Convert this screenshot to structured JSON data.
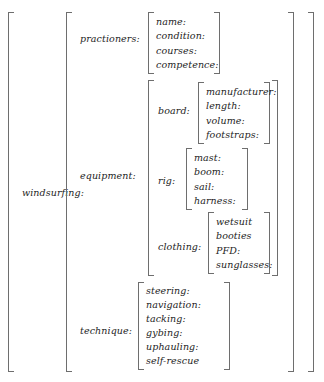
{
  "diagram": {
    "type": "attribute-value-matrix",
    "root": {
      "label": "windsurfing:"
    },
    "level2": [
      {
        "label": "practioners:"
      },
      {
        "label": "equipment:"
      },
      {
        "label": "technique:"
      }
    ],
    "level3": [
      {
        "label": "board:"
      },
      {
        "label": "rig:"
      },
      {
        "label": "clothing:"
      }
    ],
    "practioners_items": [
      "name:",
      "condition:",
      "courses:",
      "competence:"
    ],
    "board_items": [
      "manufacturer:",
      "length:",
      "volume:",
      "footstraps:"
    ],
    "rig_items": [
      "mast:",
      "boom:",
      "sail:",
      "harness:"
    ],
    "clothing_items": [
      "wetsuit",
      "booties",
      "PFD:",
      "sunglasses:"
    ],
    "technique_items": [
      "steering:",
      "navigation:",
      "tacking:",
      "gybing:",
      "uphauling:",
      "self-rescue"
    ],
    "colors": {
      "bracket": "#6e6e6e",
      "text": "#242424",
      "background": "#ffffff"
    }
  }
}
